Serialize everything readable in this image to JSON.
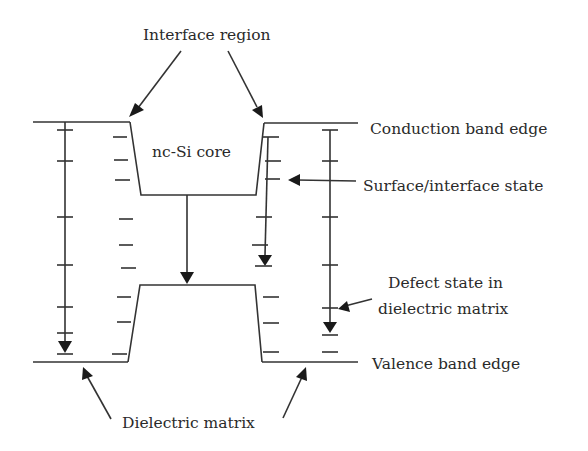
{
  "labels": {
    "interface_region": "Interface region",
    "core": "nc-Si core",
    "conduction_band_edge": "Conduction band edge",
    "surface_interface_state": "Surface/interface state",
    "defect_state_line1": "Defect state in",
    "defect_state_line2": "dielectric matrix",
    "valence_band_edge": "Valence band edge",
    "dielectric_matrix": "Dielectric matrix"
  },
  "colors": {
    "line": "#333333",
    "text": "#2a2a2a",
    "background": "#ffffff"
  }
}
